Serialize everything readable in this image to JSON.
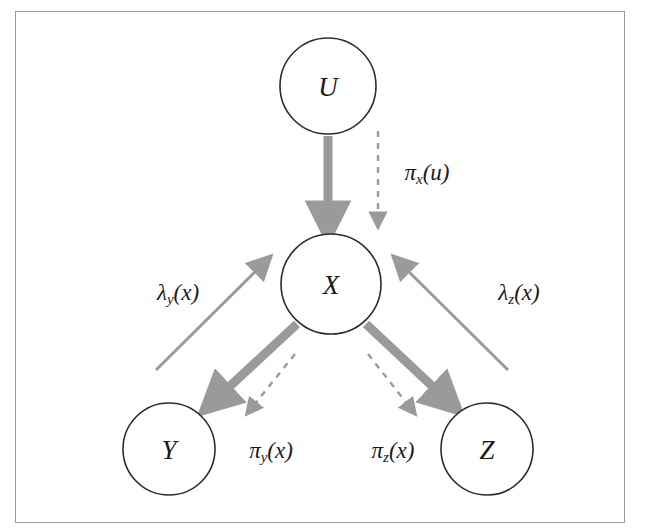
{
  "figure": {
    "caption": "",
    "background_color": "#ffffff",
    "frame_color": "#9c9ca0"
  },
  "colors": {
    "node_stroke": "#2b2b2b",
    "node_fill": "#ffffff",
    "label_text": "#1a1a1a",
    "thick_arrow": "#9a9a9a",
    "thin_arrow": "#9a9a9a",
    "dashed_arrow": "#9a9a9a"
  },
  "nodes": [
    {
      "id": "U",
      "label": "U",
      "cx": 328,
      "cy": 86,
      "r": 48
    },
    {
      "id": "X",
      "label": "X",
      "cx": 331,
      "cy": 284,
      "r": 50
    },
    {
      "id": "Y",
      "label": "Y",
      "cx": 169,
      "cy": 449,
      "r": 46
    },
    {
      "id": "Z",
      "label": "Z",
      "cx": 487,
      "cy": 449,
      "r": 46
    }
  ],
  "edges": [
    {
      "id": "u-to-x",
      "kind": "thick-solid",
      "from": "U",
      "to": "X",
      "direction": "down"
    },
    {
      "id": "x-to-y",
      "kind": "thick-solid",
      "from": "X",
      "to": "Y",
      "direction": "down-left"
    },
    {
      "id": "x-to-z",
      "kind": "thick-solid",
      "from": "X",
      "to": "Z",
      "direction": "down-right"
    },
    {
      "id": "pi-x-u",
      "kind": "dashed",
      "from": "U",
      "to": "X",
      "direction": "down"
    },
    {
      "id": "pi-y-x",
      "kind": "dashed",
      "from": "X",
      "to": "Y",
      "direction": "down-left"
    },
    {
      "id": "pi-z-x",
      "kind": "dashed",
      "from": "X",
      "to": "Z",
      "direction": "down-right"
    },
    {
      "id": "lambda-y-x",
      "kind": "thin-solid",
      "from": "Y",
      "to": "X",
      "direction": "up-right"
    },
    {
      "id": "lambda-z-x",
      "kind": "thin-solid",
      "from": "Z",
      "to": "X",
      "direction": "up-left"
    }
  ],
  "edge_labels": [
    {
      "id": "pi-x-u",
      "base": "π",
      "subscript": "x",
      "argument": "(u)",
      "text": "πx(u)",
      "x": 427,
      "y": 174
    },
    {
      "id": "lambda-y-x",
      "base": "λ",
      "subscript": "y",
      "argument": "(x)",
      "text": "λy(x)",
      "x": 178,
      "y": 294
    },
    {
      "id": "lambda-z-x",
      "base": "λ",
      "subscript": "z",
      "argument": "(x)",
      "text": "λz(x)",
      "x": 519,
      "y": 294
    },
    {
      "id": "pi-y-x",
      "base": "π",
      "subscript": "y",
      "argument": "(x)",
      "text": "πy(x)",
      "x": 271,
      "y": 452
    },
    {
      "id": "pi-z-x",
      "base": "π",
      "subscript": "z",
      "argument": "(x)",
      "text": "πz(x)",
      "x": 393,
      "y": 452
    }
  ]
}
